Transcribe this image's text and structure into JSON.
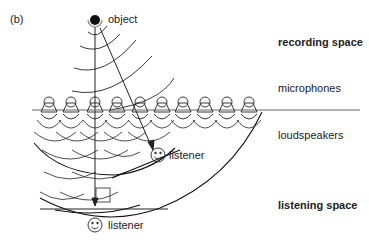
{
  "figure": {
    "panel_label": "(b)",
    "source_label": "object",
    "labels": {
      "recording_space": "recording space",
      "microphones": "microphones",
      "loudspeakers": "loudspeakers",
      "listening_space": "listening space"
    },
    "listener_near": "listener",
    "listener_far": "listener",
    "transducer_count": 10,
    "colors": {
      "stroke": "#222222",
      "line": "#555555"
    }
  }
}
